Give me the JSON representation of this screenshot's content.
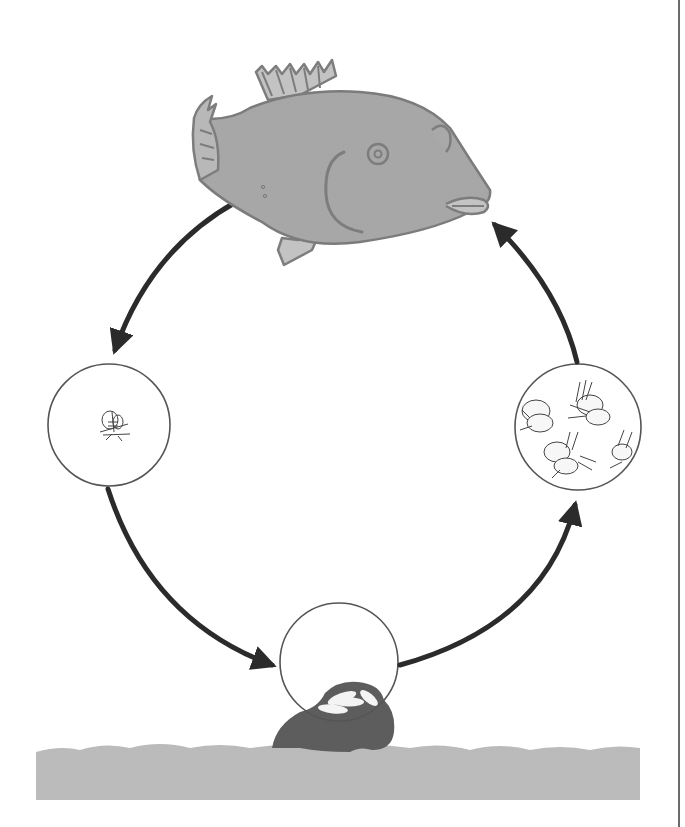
{
  "diagram": {
    "type": "life-cycle",
    "stages": [
      {
        "id": "adult-fish",
        "name": "adult fish",
        "position": "top"
      },
      {
        "id": "larva",
        "name": "larva (single)",
        "position": "left"
      },
      {
        "id": "eggs",
        "name": "eggs on rock",
        "position": "bottom"
      },
      {
        "id": "young-larvae",
        "name": "young larvae (group)",
        "position": "right"
      }
    ],
    "arrows": [
      {
        "from": "adult-fish",
        "to": "larva"
      },
      {
        "from": "larva",
        "to": "eggs"
      },
      {
        "from": "eggs",
        "to": "young-larvae"
      },
      {
        "from": "young-larvae",
        "to": "adult-fish"
      }
    ],
    "colors": {
      "fish_fill": "#a9a9a9",
      "fish_outline": "#7d7d7d",
      "arrow": "#2b2b2b",
      "circle_outline": "#555555",
      "rock": "#5e5e5e",
      "seabed": "#bdbdbd",
      "egg": "#f4f4f4"
    }
  },
  "caption": {
    "text": "",
    "note": "cut off at bottom edge"
  }
}
